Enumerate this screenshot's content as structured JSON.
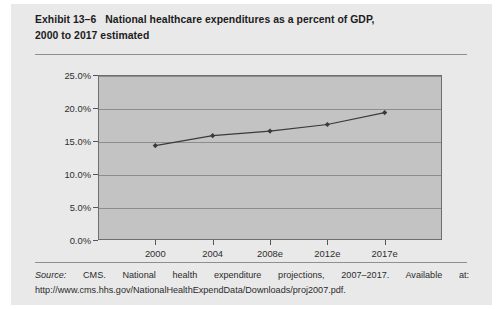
{
  "figure": {
    "title_line1_prefix": "Exhibit 13–6",
    "title_line1": "National healthcare expenditures as a percent of GDP,",
    "title_line2": "2000 to 2017 estimated",
    "source_label": "Source:",
    "source_text": " CMS. National health expenditure projections, 2007–2017. Available at: http://www.cms.hhs.gov/NationalHealthExpendData/Downloads/proj2007.pdf.",
    "background_color": "#e9e9e9",
    "plot_background_color": "#c3c3c3",
    "line_color": "#3a3a3a",
    "gridline_color": "#8d8d8d"
  },
  "chart_data": {
    "type": "line",
    "title": "National healthcare expenditures as a percent of GDP, 2000 to 2017 estimated",
    "xlabel": "",
    "ylabel": "",
    "categories": [
      "2000",
      "2004",
      "2008e",
      "2012e",
      "2017e"
    ],
    "values": [
      14.3,
      15.8,
      16.5,
      17.5,
      19.3
    ],
    "series": [
      {
        "name": "National healthcare expenditures as a percent of GDP",
        "values": [
          14.3,
          15.8,
          16.5,
          17.5,
          19.3
        ]
      }
    ],
    "ylim": [
      0.0,
      25.0
    ],
    "ytick_values": [
      0.0,
      5.0,
      10.0,
      15.0,
      20.0,
      25.0
    ],
    "ytick_labels": [
      "0.0%",
      "5.0%",
      "10.0%",
      "15.0%",
      "20.0%",
      "25.0%"
    ],
    "xtick_labels": [
      "2000",
      "2004",
      "2008e",
      "2012e",
      "2017e"
    ],
    "grid": true,
    "grid_axis": "y",
    "legend": false,
    "legend_position": "none",
    "marker": "diamond"
  }
}
